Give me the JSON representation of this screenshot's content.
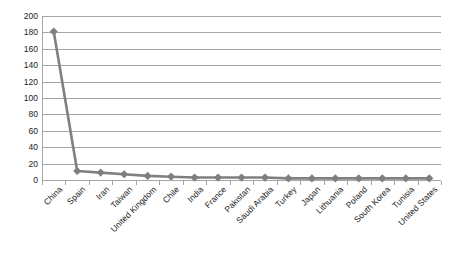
{
  "chart_data": {
    "type": "line",
    "title": "",
    "subtitle": "",
    "xlabel": "",
    "ylabel": "",
    "ylim": [
      0,
      200
    ],
    "ytick_step": 20,
    "yticks": [
      200,
      180,
      160,
      140,
      120,
      100,
      80,
      60,
      40,
      20,
      0
    ],
    "grid": "horizontal",
    "legend": "none",
    "marker": "diamond",
    "categories": [
      "China",
      "Spain",
      "Iran",
      "Taiwan",
      "United Kingdom",
      "Chile",
      "India",
      "France",
      "Pakistan",
      "Saudi Arabia",
      "Turkey",
      "Japan",
      "Lithuania",
      "Poland",
      "South Korea",
      "Tunisia",
      "United States"
    ],
    "values": [
      181,
      11,
      9,
      7,
      5,
      4,
      3,
      3,
      3,
      3,
      2,
      2,
      2,
      2,
      2,
      2,
      2
    ],
    "series": [
      {
        "name": "Series 1",
        "values": [
          181,
          11,
          9,
          7,
          5,
          4,
          3,
          3,
          3,
          3,
          2,
          2,
          2,
          2,
          2,
          2,
          2
        ]
      }
    ],
    "colors": {
      "line": "#808080",
      "marker": "#7f7f7f",
      "gridline": "#a6a6a6",
      "axis": "#a6a6a6",
      "text": "#222222",
      "background": "#ffffff"
    }
  }
}
